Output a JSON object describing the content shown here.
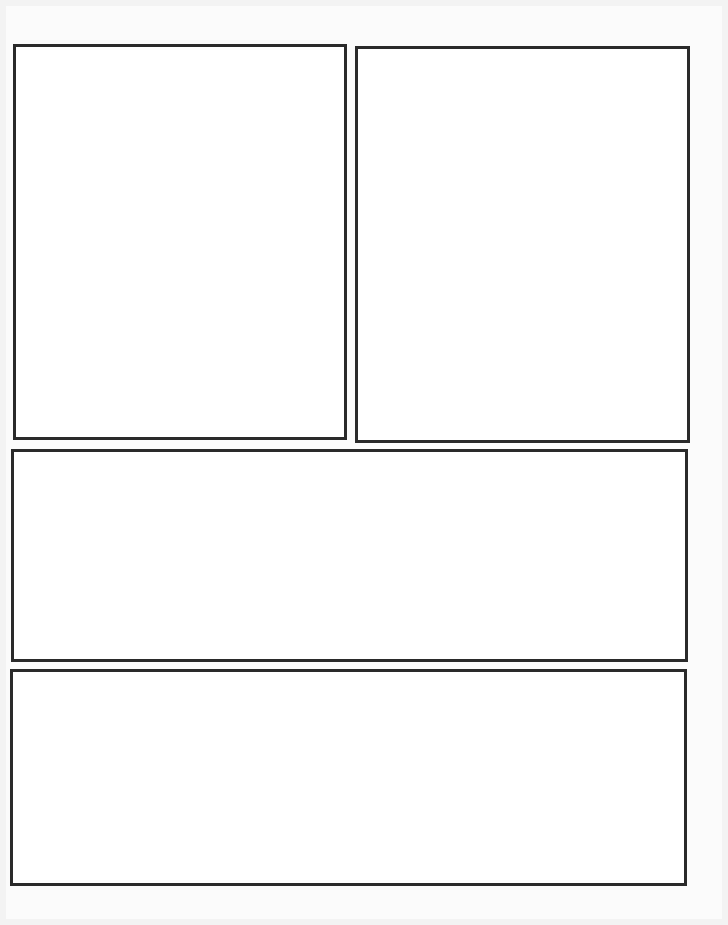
{
  "page": {
    "type": "blank comic page template",
    "background_color": "#f3f3f3",
    "panel_border_color": "#2a2a2a",
    "panel_fill_color": "#ffffff",
    "panel_count": 4
  },
  "panels": [
    {
      "id": 1,
      "label": "",
      "x": 13,
      "y": 44,
      "w": 334,
      "h": 396
    },
    {
      "id": 2,
      "label": "",
      "x": 355,
      "y": 46,
      "w": 335,
      "h": 397
    },
    {
      "id": 3,
      "label": "",
      "x": 11,
      "y": 449,
      "w": 677,
      "h": 213
    },
    {
      "id": 4,
      "label": "",
      "x": 10,
      "y": 669,
      "w": 677,
      "h": 217
    }
  ]
}
